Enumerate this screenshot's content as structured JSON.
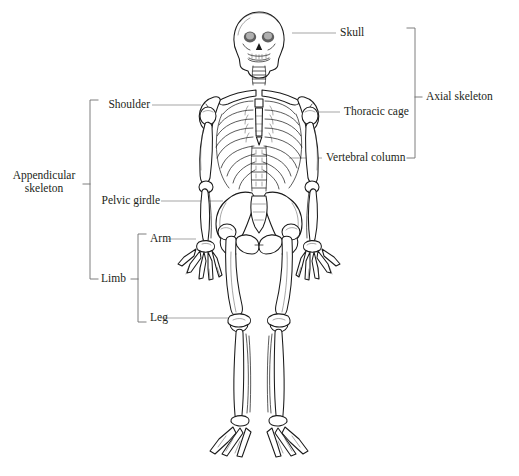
{
  "figure": {
    "background_color": "#ffffff",
    "line_color": "#1a1a1a",
    "leader_color": "#9b9b9b",
    "bracket_color": "#6f6f6f",
    "text_color": "#231f20"
  },
  "groups": [
    {
      "id": "axial",
      "label": "Axial skeleton",
      "side": "right",
      "members": [
        "Skull",
        "Thoracic cage",
        "Vertebral column"
      ]
    },
    {
      "id": "appendicular",
      "label_line1": "Appendicular",
      "label_line2": "skeleton",
      "label": "Appendicular skeleton",
      "side": "left",
      "members": [
        "Shoulder",
        "Pelvic girdle",
        "Limb"
      ]
    },
    {
      "id": "limb",
      "label": "Limb",
      "side": "left",
      "members": [
        "Arm",
        "Leg"
      ]
    }
  ],
  "labels": {
    "skull": "Skull",
    "thoracic_cage": "Thoracic cage",
    "vertebral_column": "Vertebral column",
    "axial_skeleton": "Axial skeleton",
    "shoulder": "Shoulder",
    "pelvic_girdle": "Pelvic girdle",
    "appendicular_line1": "Appendicular",
    "appendicular_line2": "skeleton",
    "arm": "Arm",
    "leg": "Leg",
    "limb": "Limb"
  }
}
